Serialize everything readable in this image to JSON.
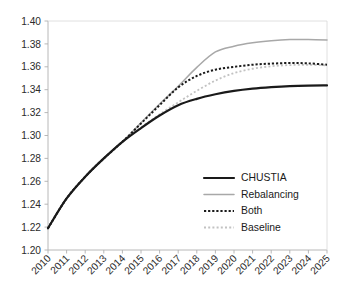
{
  "chart_data": {
    "type": "line",
    "title": "",
    "subtitle": "",
    "xlabel": "",
    "ylabel": "",
    "x": [
      2010,
      2011,
      2012,
      2013,
      2014,
      2015,
      2016,
      2017,
      2018,
      2019,
      2020,
      2021,
      2022,
      2023,
      2024,
      2025
    ],
    "xlim": [
      2010,
      2025
    ],
    "ylim": [
      1.2,
      1.4
    ],
    "yticks": [
      "1.20",
      "1.22",
      "1.24",
      "1.26",
      "1.28",
      "1.30",
      "1.32",
      "1.34",
      "1.36",
      "1.38",
      "1.40"
    ],
    "xticks": [
      "2010",
      "2011",
      "2012",
      "2013",
      "2014",
      "2015",
      "2016",
      "2017",
      "2018",
      "2019",
      "2020",
      "2021",
      "2022",
      "2023",
      "2024",
      "2025"
    ],
    "grid": false,
    "legend_position": "inside-lower-right",
    "series": [
      {
        "name": "CHUSTIA",
        "color": "#1a1a1a",
        "style": "solid",
        "width": 2.2,
        "values": [
          1.219,
          1.245,
          1.264,
          1.28,
          1.2945,
          1.3065,
          1.3175,
          1.3265,
          1.332,
          1.336,
          1.339,
          1.341,
          1.3423,
          1.3432,
          1.3436,
          1.3437
        ]
      },
      {
        "name": "Rebalancing",
        "color": "#a8a8a8",
        "style": "solid",
        "width": 1.5,
        "values": [
          1.219,
          1.245,
          1.264,
          1.28,
          1.2945,
          1.311,
          1.3275,
          1.343,
          1.3595,
          1.373,
          1.378,
          1.381,
          1.3828,
          1.3838,
          1.3838,
          1.3835
        ]
      },
      {
        "name": "Both",
        "color": "#1a1a1a",
        "style": "dotted",
        "width": 2.0,
        "values": [
          1.219,
          1.245,
          1.264,
          1.28,
          1.2945,
          1.3105,
          1.3265,
          1.342,
          1.352,
          1.3575,
          1.36,
          1.3618,
          1.3628,
          1.3633,
          1.363,
          1.3618
        ]
      },
      {
        "name": "Baseline",
        "color": "#c2c2c2",
        "style": "dotted",
        "width": 1.8,
        "values": [
          1.219,
          1.245,
          1.264,
          1.28,
          1.2945,
          1.307,
          1.3185,
          1.329,
          1.339,
          1.348,
          1.3545,
          1.3583,
          1.3605,
          1.3615,
          1.3617,
          1.3613
        ]
      }
    ]
  },
  "legend": {
    "entries": [
      {
        "label": "CHUSTIA"
      },
      {
        "label": "Rebalancing"
      },
      {
        "label": "Both"
      },
      {
        "label": "Baseline"
      }
    ]
  },
  "colors": {
    "axis": "#b0b0b0",
    "tick_text": "#2b2b2b",
    "plot_background": "#ffffff"
  }
}
